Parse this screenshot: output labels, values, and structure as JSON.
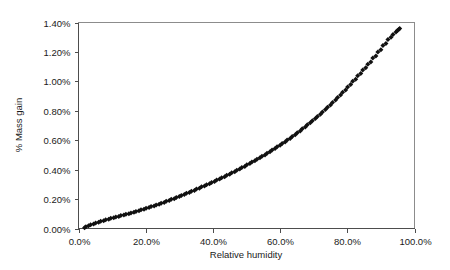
{
  "chart_data": {
    "type": "scatter",
    "title": "",
    "xlabel": "Relative humidity",
    "ylabel": "% Mass gain",
    "xlim": [
      0,
      100
    ],
    "ylim": [
      0,
      1.4
    ],
    "x_tick_labels": [
      "0.0%",
      "20.0%",
      "40.0%",
      "60.0%",
      "80.0%",
      "100.0%"
    ],
    "x_tick_values": [
      0,
      20,
      40,
      60,
      80,
      100
    ],
    "y_tick_labels": [
      "0.00%",
      "0.20%",
      "0.40%",
      "0.60%",
      "0.80%",
      "1.00%",
      "1.20%",
      "1.40%"
    ],
    "y_tick_values": [
      0,
      0.2,
      0.4,
      0.6,
      0.8,
      1.0,
      1.2,
      1.4
    ],
    "grid": false,
    "legend": false,
    "legend_position": "none",
    "marker_style": "filled-diamond",
    "marker_color": "#111111",
    "series": [
      {
        "name": "Sorption",
        "points": [
          [
            1.8,
            0.005
          ],
          [
            3.0,
            0.018
          ],
          [
            4.5,
            0.03
          ],
          [
            6.0,
            0.042
          ],
          [
            7.5,
            0.053
          ],
          [
            9.0,
            0.063
          ],
          [
            10.5,
            0.073
          ],
          [
            12.0,
            0.082
          ],
          [
            13.5,
            0.091
          ],
          [
            15.0,
            0.1
          ],
          [
            16.5,
            0.11
          ],
          [
            18.0,
            0.12
          ],
          [
            19.5,
            0.131
          ],
          [
            21.0,
            0.142
          ],
          [
            22.5,
            0.153
          ],
          [
            24.0,
            0.165
          ],
          [
            25.5,
            0.177
          ],
          [
            27.0,
            0.19
          ],
          [
            28.5,
            0.203
          ],
          [
            30.0,
            0.217
          ],
          [
            31.5,
            0.231
          ],
          [
            33.0,
            0.245
          ],
          [
            34.5,
            0.259
          ],
          [
            36.0,
            0.274
          ],
          [
            37.5,
            0.289
          ],
          [
            39.0,
            0.304
          ],
          [
            40.5,
            0.32
          ],
          [
            42.0,
            0.336
          ],
          [
            43.5,
            0.352
          ],
          [
            45.0,
            0.369
          ],
          [
            46.5,
            0.386
          ],
          [
            48.0,
            0.404
          ],
          [
            49.5,
            0.422
          ],
          [
            51.0,
            0.441
          ],
          [
            52.5,
            0.46
          ],
          [
            54.0,
            0.48
          ],
          [
            55.5,
            0.5
          ],
          [
            57.0,
            0.521
          ],
          [
            58.5,
            0.543
          ],
          [
            60.0,
            0.565
          ],
          [
            61.5,
            0.588
          ],
          [
            63.0,
            0.612
          ],
          [
            64.5,
            0.637
          ],
          [
            66.0,
            0.663
          ],
          [
            67.5,
            0.69
          ],
          [
            69.0,
            0.718
          ],
          [
            70.5,
            0.747
          ],
          [
            72.0,
            0.777
          ],
          [
            73.5,
            0.808
          ],
          [
            75.0,
            0.84
          ],
          [
            76.5,
            0.873
          ],
          [
            78.0,
            0.907
          ],
          [
            79.5,
            0.942
          ],
          [
            81.0,
            0.978
          ],
          [
            82.5,
            1.015
          ],
          [
            84.0,
            1.053
          ],
          [
            85.5,
            1.092
          ],
          [
            87.0,
            1.132
          ],
          [
            88.5,
            1.173
          ],
          [
            90.0,
            1.215
          ],
          [
            91.5,
            1.258
          ],
          [
            93.0,
            1.3
          ],
          [
            94.5,
            1.335
          ],
          [
            95.3,
            1.352
          ]
        ]
      },
      {
        "name": "Desorption",
        "points": [
          [
            2.2,
            0.012
          ],
          [
            3.6,
            0.025
          ],
          [
            5.1,
            0.037
          ],
          [
            6.6,
            0.049
          ],
          [
            8.1,
            0.059
          ],
          [
            9.6,
            0.069
          ],
          [
            11.1,
            0.078
          ],
          [
            12.6,
            0.088
          ],
          [
            14.1,
            0.097
          ],
          [
            15.6,
            0.106
          ],
          [
            17.1,
            0.116
          ],
          [
            18.6,
            0.127
          ],
          [
            20.1,
            0.138
          ],
          [
            21.6,
            0.149
          ],
          [
            23.1,
            0.16
          ],
          [
            24.6,
            0.172
          ],
          [
            26.1,
            0.185
          ],
          [
            27.6,
            0.198
          ],
          [
            29.1,
            0.211
          ],
          [
            30.6,
            0.225
          ],
          [
            32.1,
            0.239
          ],
          [
            33.6,
            0.253
          ],
          [
            35.1,
            0.268
          ],
          [
            36.6,
            0.283
          ],
          [
            38.1,
            0.298
          ],
          [
            39.6,
            0.313
          ],
          [
            41.1,
            0.329
          ],
          [
            42.6,
            0.345
          ],
          [
            44.1,
            0.362
          ],
          [
            45.6,
            0.379
          ],
          [
            47.1,
            0.396
          ],
          [
            48.6,
            0.414
          ],
          [
            50.1,
            0.433
          ],
          [
            51.6,
            0.452
          ],
          [
            53.1,
            0.471
          ],
          [
            54.6,
            0.491
          ],
          [
            56.1,
            0.512
          ],
          [
            57.6,
            0.533
          ],
          [
            59.1,
            0.555
          ],
          [
            60.6,
            0.578
          ],
          [
            62.1,
            0.602
          ],
          [
            63.6,
            0.626
          ],
          [
            65.1,
            0.651
          ],
          [
            66.6,
            0.678
          ],
          [
            68.1,
            0.705
          ],
          [
            69.6,
            0.733
          ],
          [
            71.1,
            0.762
          ],
          [
            72.6,
            0.792
          ],
          [
            74.1,
            0.824
          ],
          [
            75.6,
            0.857
          ],
          [
            77.1,
            0.891
          ],
          [
            78.6,
            0.926
          ],
          [
            80.1,
            0.962
          ],
          [
            81.6,
            1.0
          ],
          [
            83.1,
            1.038
          ],
          [
            84.6,
            1.077
          ],
          [
            86.1,
            1.117
          ],
          [
            87.6,
            1.158
          ],
          [
            89.1,
            1.2
          ],
          [
            90.6,
            1.243
          ],
          [
            92.1,
            1.285
          ],
          [
            93.6,
            1.318
          ],
          [
            94.9,
            1.345
          ],
          [
            95.6,
            1.36
          ]
        ]
      }
    ]
  },
  "axes": {
    "x_title": "Relative humidity",
    "y_title": "% Mass gain"
  }
}
